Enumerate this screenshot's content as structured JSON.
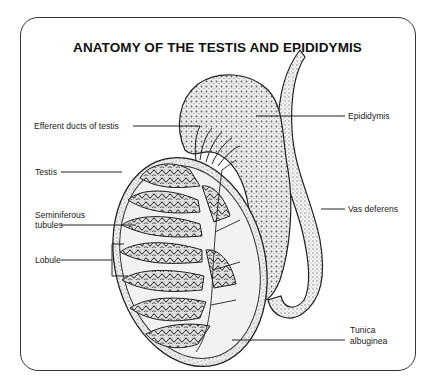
{
  "title": "ANATOMY OF THE TESTIS AND EPIDIDYMIS",
  "labels": {
    "efferent_ducts": "Efferent ducts of testis",
    "testis": "Testis",
    "seminiferous_line1": "Seminiferous",
    "seminiferous_line2": "tubules",
    "lobule": "Lobule",
    "epididymis": "Epididymis",
    "vas_deferens": "Vas deferens",
    "tunica_line1": "Tunica",
    "tunica_line2": "albuginea"
  },
  "colors": {
    "ink": "#222222",
    "stipple": "#9a9a9a",
    "background": "#ffffff"
  }
}
